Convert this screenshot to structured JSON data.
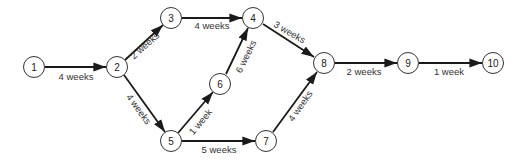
{
  "diagram": {
    "type": "activity-network",
    "nodes": [
      {
        "id": "1",
        "label": "1",
        "x": 34,
        "y": 67
      },
      {
        "id": "2",
        "label": "2",
        "x": 117,
        "y": 67
      },
      {
        "id": "3",
        "label": "3",
        "x": 171,
        "y": 18
      },
      {
        "id": "4",
        "label": "4",
        "x": 253,
        "y": 18
      },
      {
        "id": "5",
        "label": "5",
        "x": 171,
        "y": 141
      },
      {
        "id": "6",
        "label": "6",
        "x": 220,
        "y": 84
      },
      {
        "id": "7",
        "label": "7",
        "x": 266,
        "y": 141
      },
      {
        "id": "8",
        "label": "8",
        "x": 324,
        "y": 63
      },
      {
        "id": "9",
        "label": "9",
        "x": 408,
        "y": 63
      },
      {
        "id": "10",
        "label": "10",
        "x": 493,
        "y": 63
      }
    ],
    "edges": [
      {
        "from": "1",
        "to": "2",
        "label": "4 weeks"
      },
      {
        "from": "2",
        "to": "3",
        "label": "2 weeks"
      },
      {
        "from": "2",
        "to": "5",
        "label": "4 weeks"
      },
      {
        "from": "3",
        "to": "4",
        "label": "4 weeks"
      },
      {
        "from": "5",
        "to": "6",
        "label": "1 week"
      },
      {
        "from": "6",
        "to": "4",
        "label": "6 weeks"
      },
      {
        "from": "5",
        "to": "7",
        "label": "5 weeks"
      },
      {
        "from": "4",
        "to": "8",
        "label": "3 weeks"
      },
      {
        "from": "7",
        "to": "8",
        "label": "4 weeks"
      },
      {
        "from": "8",
        "to": "9",
        "label": "2 weeks"
      },
      {
        "from": "9",
        "to": "10",
        "label": "1 week"
      }
    ]
  },
  "colors": {
    "line": "#1a1a1a",
    "node_stroke": "#333333",
    "text": "#333333",
    "background": "#ffffff"
  }
}
